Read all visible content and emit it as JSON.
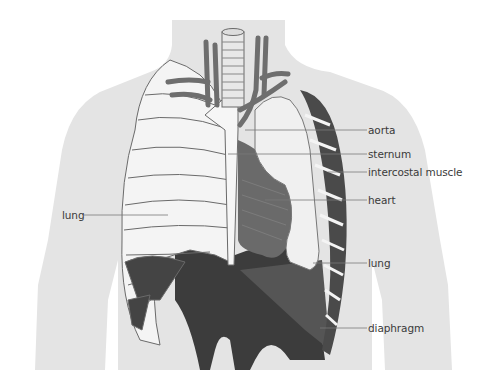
{
  "diagram": {
    "colors": {
      "background": "#ffffff",
      "silhouette": "#e4e4e4",
      "bone": "#f4f4f4",
      "bone_outline": "#6a6a6a",
      "lung": "#ececec",
      "muscle": "#5a5a5a",
      "vessel": "#6e6e6e",
      "leader_line": "#7a7a7a",
      "label_text": "#3a3a3a"
    },
    "labels": [
      {
        "id": "aorta",
        "text": "aorta"
      },
      {
        "id": "sternum",
        "text": "sternum"
      },
      {
        "id": "intercostal-muscle",
        "text": "intercostal muscle"
      },
      {
        "id": "heart",
        "text": "heart"
      },
      {
        "id": "lung-left",
        "text": "lung"
      },
      {
        "id": "lung-right",
        "text": "lung"
      },
      {
        "id": "diaphragm",
        "text": "diaphragm"
      }
    ]
  }
}
